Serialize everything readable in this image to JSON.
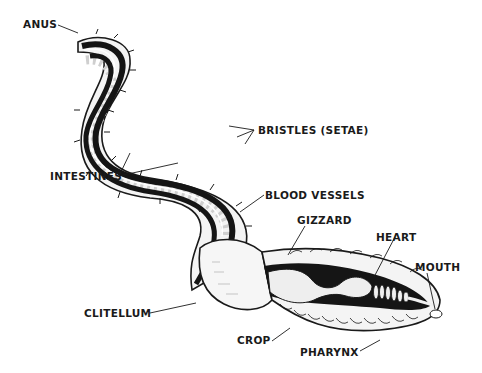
{
  "diagram": {
    "labels": {
      "anus": "ANUS",
      "bristles": "BRISTLES (SETAE)",
      "intestines": "INTESTINES",
      "blood_vessels": "BLOOD VESSELS",
      "gizzard": "GIZZARD",
      "heart": "HEART",
      "mouth": "MOUTH",
      "clitellum": "CLITELLUM",
      "crop": "CROP",
      "pharynx": "PHARYNX"
    },
    "colors": {
      "ink": "#1a1a1a",
      "body_fill": "#f4f4f4",
      "segment_shade": "#cfcfcf",
      "cavity": "#151515",
      "background": "#ffffff"
    }
  }
}
